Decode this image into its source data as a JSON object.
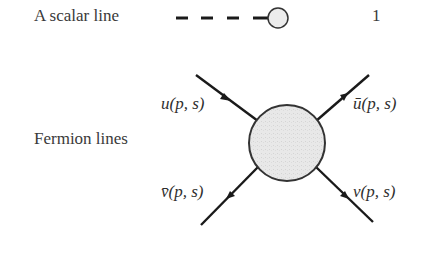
{
  "rows": [
    {
      "label": "A scalar line",
      "value": "1"
    },
    {
      "label": "Fermion lines"
    }
  ],
  "fermion_labels": {
    "incoming_top_left": "u(p, s)",
    "outgoing_top_right": "ū(p, s)",
    "outgoing_bottom_left": "v̄(p, s)",
    "outgoing_bottom_right": "v(p, s)"
  },
  "colors": {
    "line": "#1a1a1a",
    "blob_fill": "#e6e6e6",
    "blob_stroke": "#333333",
    "text": "#2f2f2f"
  }
}
